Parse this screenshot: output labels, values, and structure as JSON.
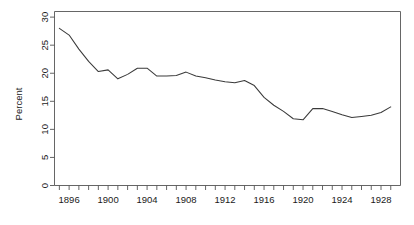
{
  "chart_data": {
    "type": "line",
    "title": "",
    "subtitle": "",
    "xlabel": "",
    "ylabel": "Percent",
    "grid": false,
    "legend": "none",
    "xlim": [
      1894.5,
      1930.0
    ],
    "ylim": [
      0,
      31
    ],
    "yticks": [
      0,
      5,
      10,
      15,
      20,
      25,
      30
    ],
    "ytick_labels": [
      "0",
      "5",
      "10",
      "15",
      "20",
      "25",
      "30"
    ],
    "xticks": [
      1895,
      1896,
      1897,
      1898,
      1899,
      1900,
      1901,
      1902,
      1903,
      1904,
      1905,
      1906,
      1907,
      1908,
      1909,
      1910,
      1911,
      1912,
      1913,
      1914,
      1915,
      1916,
      1917,
      1918,
      1919,
      1920,
      1921,
      1922,
      1923,
      1924,
      1925,
      1926,
      1927,
      1928,
      1929
    ],
    "xtick_labels_shown": [
      "1896",
      "1900",
      "1904",
      "1908",
      "1912",
      "1916",
      "1920",
      "1924",
      "1928"
    ],
    "xtick_label_years": [
      1896,
      1900,
      1904,
      1908,
      1912,
      1916,
      1920,
      1924,
      1928
    ],
    "x": [
      1895,
      1896,
      1897,
      1898,
      1899,
      1900,
      1901,
      1902,
      1903,
      1904,
      1905,
      1906,
      1907,
      1908,
      1909,
      1910,
      1911,
      1912,
      1913,
      1914,
      1915,
      1916,
      1917,
      1918,
      1919,
      1920,
      1921,
      1922,
      1923,
      1924,
      1925,
      1926,
      1927,
      1928,
      1929
    ],
    "values": [
      28.0,
      26.8,
      24.3,
      22.1,
      20.3,
      20.6,
      19.0,
      19.8,
      20.9,
      20.9,
      19.5,
      19.5,
      19.6,
      20.2,
      19.5,
      19.2,
      18.8,
      18.5,
      18.3,
      18.7,
      17.8,
      15.7,
      14.3,
      13.2,
      11.9,
      11.7,
      13.7,
      13.7,
      13.2,
      12.6,
      12.1,
      12.3,
      12.5,
      13.0,
      14.0
    ],
    "series": [
      {
        "name": "Percent",
        "color": "#3a3a3a",
        "values": [
          28.0,
          26.8,
          24.3,
          22.1,
          20.3,
          20.6,
          19.0,
          19.8,
          20.9,
          20.9,
          19.5,
          19.5,
          19.6,
          20.2,
          19.5,
          19.2,
          18.8,
          18.5,
          18.3,
          18.7,
          17.8,
          15.7,
          14.3,
          13.2,
          11.9,
          11.7,
          13.7,
          13.7,
          13.2,
          12.6,
          12.1,
          12.3,
          12.5,
          13.0,
          14.0
        ]
      }
    ]
  },
  "axes": {
    "y_axis_title": "Percent"
  }
}
